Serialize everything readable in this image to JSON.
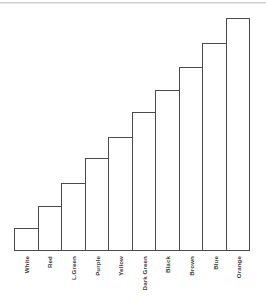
{
  "chart_data": {
    "type": "bar",
    "title": "",
    "subtitle": "",
    "xlabel": "",
    "ylabel": "",
    "grid": false,
    "legend": "none",
    "axis_style": "baseline-only",
    "orientation": "vertical",
    "bar_style": "outlined-unfilled",
    "bar_outline_color": "#4a4a4a",
    "bar_fill_color": "#ffffff",
    "background_color": "#ffffff",
    "ylim": [
      0,
      100
    ],
    "tick_labels_y": [],
    "label_rotation_degrees": 90,
    "categories": [
      "White",
      "Red",
      "L.Green",
      "Purple",
      "Yellow",
      "Dark Green",
      "Black",
      "Brown",
      "Blue",
      "Orange"
    ],
    "values": [
      10,
      19,
      29,
      39,
      48,
      59,
      68,
      78,
      88,
      99
    ],
    "bar_heights_px": [
      23,
      45,
      68,
      93,
      114,
      139,
      161,
      184,
      208,
      233
    ]
  },
  "bars": [
    {
      "label": "White",
      "height_pct": 9.7
    },
    {
      "label": "Red",
      "height_pct": 19.0
    },
    {
      "label": "L.Green",
      "height_pct": 28.7
    },
    {
      "label": "Purple",
      "height_pct": 39.2
    },
    {
      "label": "Yellow",
      "height_pct": 48.1
    },
    {
      "label": "Dark Green",
      "height_pct": 58.6
    },
    {
      "label": "Black",
      "height_pct": 67.9
    },
    {
      "label": "Brown",
      "height_pct": 77.6
    },
    {
      "label": "Blue",
      "height_pct": 87.8
    },
    {
      "label": "Orange",
      "height_pct": 98.3
    }
  ]
}
